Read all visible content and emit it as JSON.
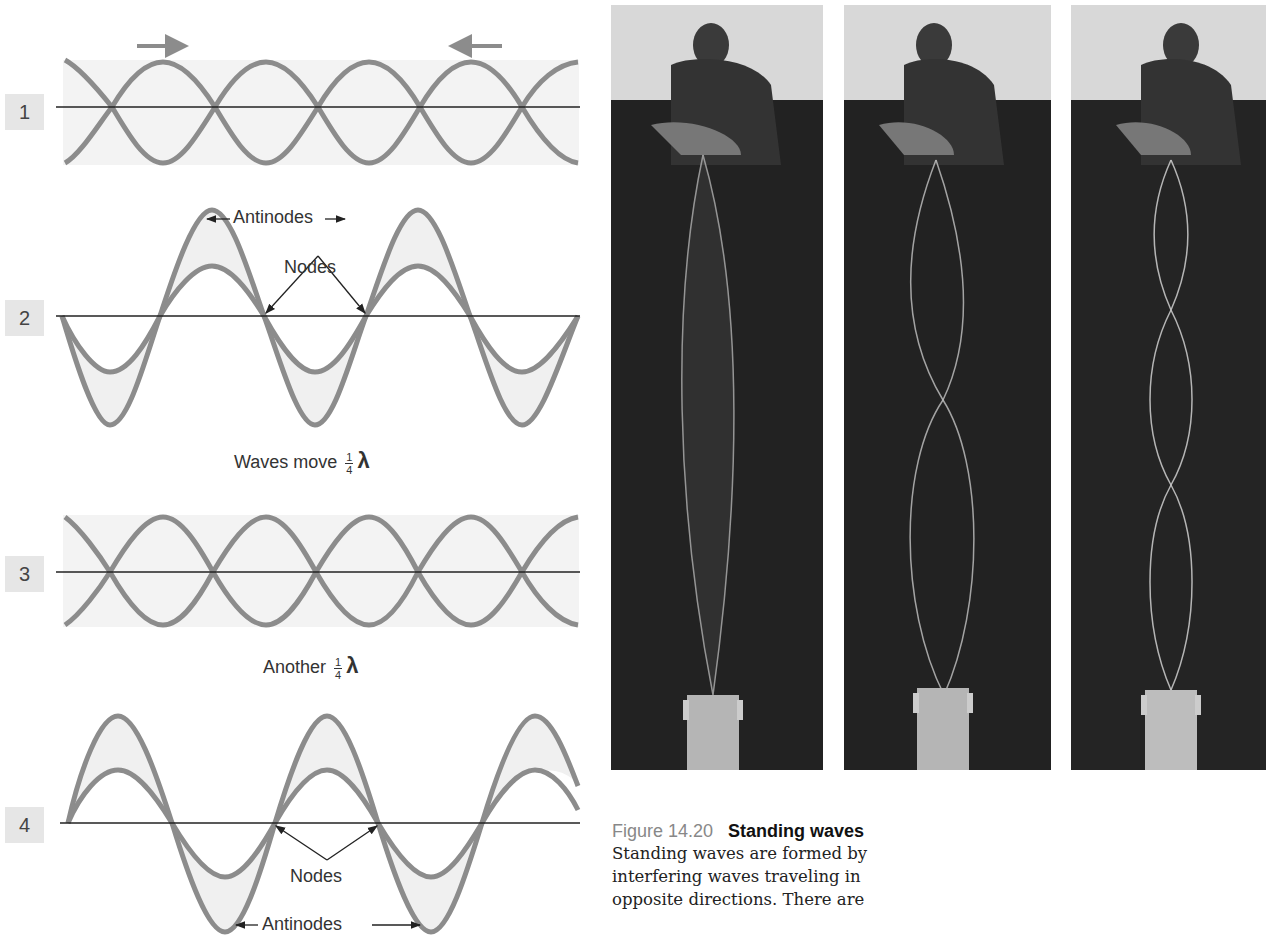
{
  "figure": {
    "number": "Figure 14.20",
    "title": "Standing waves",
    "body_lines": [
      "Standing waves are formed by",
      "interfering waves traveling in",
      "opposite directions. There are"
    ]
  },
  "panels": [
    {
      "id": "1",
      "label": "1"
    },
    {
      "id": "2",
      "label": "2"
    },
    {
      "id": "3",
      "label": "3"
    },
    {
      "id": "4",
      "label": "4"
    }
  ],
  "annotations": {
    "antinodes_top": "Antinodes",
    "nodes_top": "Nodes",
    "step1_text": "Waves move",
    "step2_text": "Another",
    "fraction_num": "1",
    "fraction_den": "4",
    "lambda": "λ",
    "nodes_bottom": "Nodes",
    "antinodes_bottom": "Antinodes"
  },
  "icons": {
    "arrow_right": "arrow-right-icon",
    "arrow_left": "arrow-left-icon"
  },
  "colors": {
    "wave_stroke": "#8c8c8c",
    "wave_fill": "#f0f0f0",
    "axis": "#222222",
    "badge_bg": "#e6e6e6",
    "photo_bg": "#1b1b1b"
  },
  "photos": [
    {
      "id": "photo-1-loop",
      "loops": 1
    },
    {
      "id": "photo-2-loops",
      "loops": 2
    },
    {
      "id": "photo-3-loops",
      "loops": 3
    }
  ]
}
